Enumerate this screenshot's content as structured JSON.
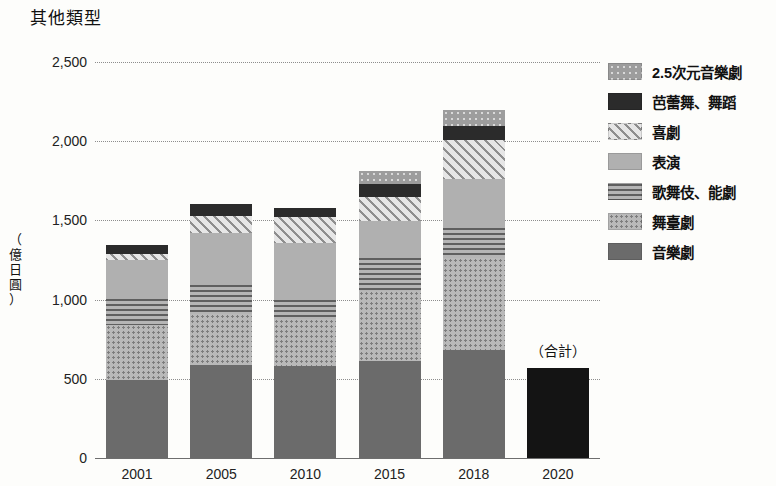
{
  "chart_data": {
    "type": "bar",
    "title": "其他類型",
    "xlabel": "",
    "ylabel": "（億日圓）",
    "ylabel_chars": [
      "（",
      "億",
      "日",
      "圓",
      "）"
    ],
    "categories": [
      "2001",
      "2005",
      "2010",
      "2015",
      "2018",
      "2020"
    ],
    "ylim": [
      0,
      2500
    ],
    "yticks": [
      "0",
      "500",
      "1,000",
      "1,500",
      "2,000",
      "2,500"
    ],
    "ytick_values": [
      0,
      500,
      1000,
      1500,
      2000,
      2500
    ],
    "grid": true,
    "stacked": true,
    "legend_position": "right",
    "annotations": [
      {
        "text": "（合計）",
        "category": "2020"
      }
    ],
    "series": [
      {
        "name": "音樂劇",
        "pattern": "solid-dark-gray",
        "color": "#6b6b6b",
        "values": [
          490,
          590,
          580,
          615,
          680,
          0
        ]
      },
      {
        "name": "舞臺劇",
        "pattern": "light-dots",
        "color": "#b9b9b9",
        "values": [
          350,
          320,
          300,
          440,
          580,
          0
        ]
      },
      {
        "name": "歌舞伎、能劇",
        "pattern": "horizontal-lines",
        "color": "#9a9a9a",
        "values": [
          165,
          180,
          120,
          210,
          190,
          0
        ]
      },
      {
        "name": "表演",
        "pattern": "plain-gray",
        "color": "#b0b0b0",
        "values": [
          245,
          330,
          355,
          230,
          310,
          0
        ]
      },
      {
        "name": "喜劇",
        "pattern": "diagonal-hatch",
        "color": "#dcdcdc",
        "values": [
          40,
          110,
          165,
          150,
          250,
          0
        ]
      },
      {
        "name": "芭蕾舞、舞蹈",
        "pattern": "solid-black",
        "color": "#2b2b2b",
        "values": [
          55,
          75,
          60,
          85,
          85,
          0
        ]
      },
      {
        "name": "2.5次元音樂劇",
        "pattern": "dark-gray-light-dots",
        "color": "#9d9d9d",
        "values": [
          0,
          0,
          0,
          85,
          105,
          0
        ]
      },
      {
        "name": "（合計）",
        "pattern": "solid-black-total",
        "color": "#141414",
        "values": [
          0,
          0,
          0,
          0,
          0,
          570
        ]
      }
    ],
    "totals": [
      1345,
      1605,
      1580,
      1815,
      2200,
      570
    ]
  },
  "legend": {
    "items": [
      {
        "label": "2.5次元音樂劇",
        "pattern": "p-25d"
      },
      {
        "label": "芭蕾舞、舞蹈",
        "pattern": "p-ballet"
      },
      {
        "label": "喜劇",
        "pattern": "p-comedy"
      },
      {
        "label": "表演",
        "pattern": "p-performance"
      },
      {
        "label": "歌舞伎、能劇",
        "pattern": "p-kabuki"
      },
      {
        "label": "舞臺劇",
        "pattern": "p-stage"
      },
      {
        "label": "音樂劇",
        "pattern": "p-musical"
      }
    ]
  }
}
